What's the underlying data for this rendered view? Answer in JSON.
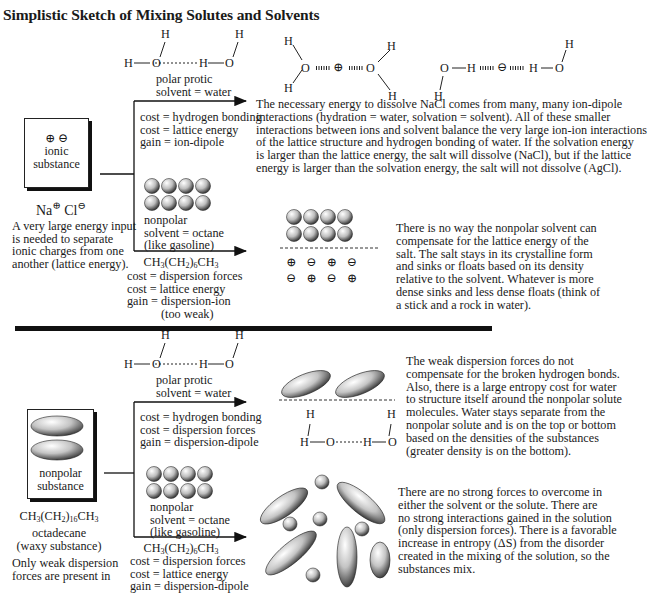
{
  "title": "Simplistic Sketch of Mixing Solutes and Solvents",
  "colors": {
    "ink": "#1a1a1a",
    "sphere_light": "#f2f2f2",
    "sphere_dark": "#555555",
    "divider": "#111111"
  },
  "water_dimer": {
    "h": "H",
    "o": "O",
    "bond_label": "hydrogen bond (dotted)"
  },
  "top": {
    "solute_box": {
      "charges": "⊕ ⊖",
      "label_line1": "ionic",
      "label_line2": "substance"
    },
    "formula_na": "Na",
    "formula_cl": "Cl",
    "plus": "⊕",
    "minus": "⊖",
    "solute_note": [
      "A very large energy input",
      "is needed to separate",
      "ionic charges from one",
      "another (lattice energy)."
    ],
    "water_label": [
      "polar protic",
      "solvent = water"
    ],
    "water_costs": [
      "cost = hydrogen bonding",
      "cost = lattice energy",
      "gain = ion-dipole"
    ],
    "hydration_symbols": {
      "cation": "⊕",
      "anion": "⊖",
      "o": "O",
      "h": "H"
    },
    "water_result": [
      "The necessary energy to dissolve NaCl comes from many, many ion-dipole",
      "interactions (hydration = water, solvation = solvent).  All of these smaller",
      "interactions between ions and solvent balance the very large ion-ion interactions",
      "of the lattice structure and hydrogen bonding of water.  If the solvation energy",
      "is larger than the lattice energy,  the salt will dissolve (NaCl), but if the lattice",
      "energy is larger than the solvation energy, the salt will not dissolve (AgCl)."
    ],
    "octane_label": [
      "nonpolar",
      "solvent = octane",
      "(like gasoline)"
    ],
    "octane_formula": {
      "a": "CH",
      "s1": "3",
      "b": "(CH",
      "s2": "2",
      "c": ")",
      "s3": "6",
      "d": "CH",
      "s4": "3"
    },
    "octane_costs": [
      "cost = dispersion forces",
      "cost = lattice energy",
      "gain = dispersion-ion",
      "(too weak)"
    ],
    "ion_rows": [
      [
        "⊕",
        "⊖",
        "⊕",
        "⊖"
      ],
      [
        "⊖",
        "⊕",
        "⊖",
        "⊕"
      ]
    ],
    "octane_result": [
      "There is no way the nonpolar solvent can",
      "compensate for the lattice energy of the",
      "salt.  The salt stays in its crystalline form",
      "and sinks or floats based on its density",
      "relative to the solvent.  Whatever is more",
      "dense sinks and less dense floats (think of",
      "a stick and a rock in water)."
    ]
  },
  "bottom": {
    "solute_box": {
      "label_line1": "nonpolar",
      "label_line2": "substance"
    },
    "formula": {
      "a": "CH",
      "s1": "3",
      "b": "(CH",
      "s2": "2",
      "c": ")",
      "s3": "16",
      "d": "CH",
      "s4": "3"
    },
    "name": "octadecane",
    "desc": "(waxy substance)",
    "solute_note": [
      "Only weak dispersion",
      "forces are present in"
    ],
    "water_label": [
      "polar protic",
      "solvent = water"
    ],
    "water_costs": [
      "cost = hydrogen bonding",
      "cost = dispersion forces",
      "gain = dispersion-dipole"
    ],
    "water_result": [
      "The weak dispersion forces do not",
      "compensate for the broken hydrogen bonds.",
      "Also, there is a large entropy cost for water",
      "to structure itself around the nonpolar solute",
      "molecules.  Water stays separate from the",
      "nonpolar solute and is on the top or bottom",
      "based on the densities of the substances",
      "(greater density is on the bottom)."
    ],
    "octane_label": [
      "nonpolar",
      "solvent = octane",
      "(like gasoline)"
    ],
    "octane_formula": {
      "a": "CH",
      "s1": "3",
      "b": "(CH",
      "s2": "2",
      "c": ")",
      "s3": "6",
      "d": "CH",
      "s4": "3"
    },
    "octane_costs": [
      "cost = dispersion forces",
      "cost = lattice energy",
      "gain = dispersion-dipole"
    ],
    "octane_result": [
      "There are no strong forces to overcome in",
      "either the solvent or the solute.  There are",
      "no strong interactions gained in the solution",
      "(only dispersion forces). There is a favorable",
      "increase in entropy (ΔS) from the disorder",
      "created in the mixing of the solution, so the",
      "substances mix."
    ]
  }
}
